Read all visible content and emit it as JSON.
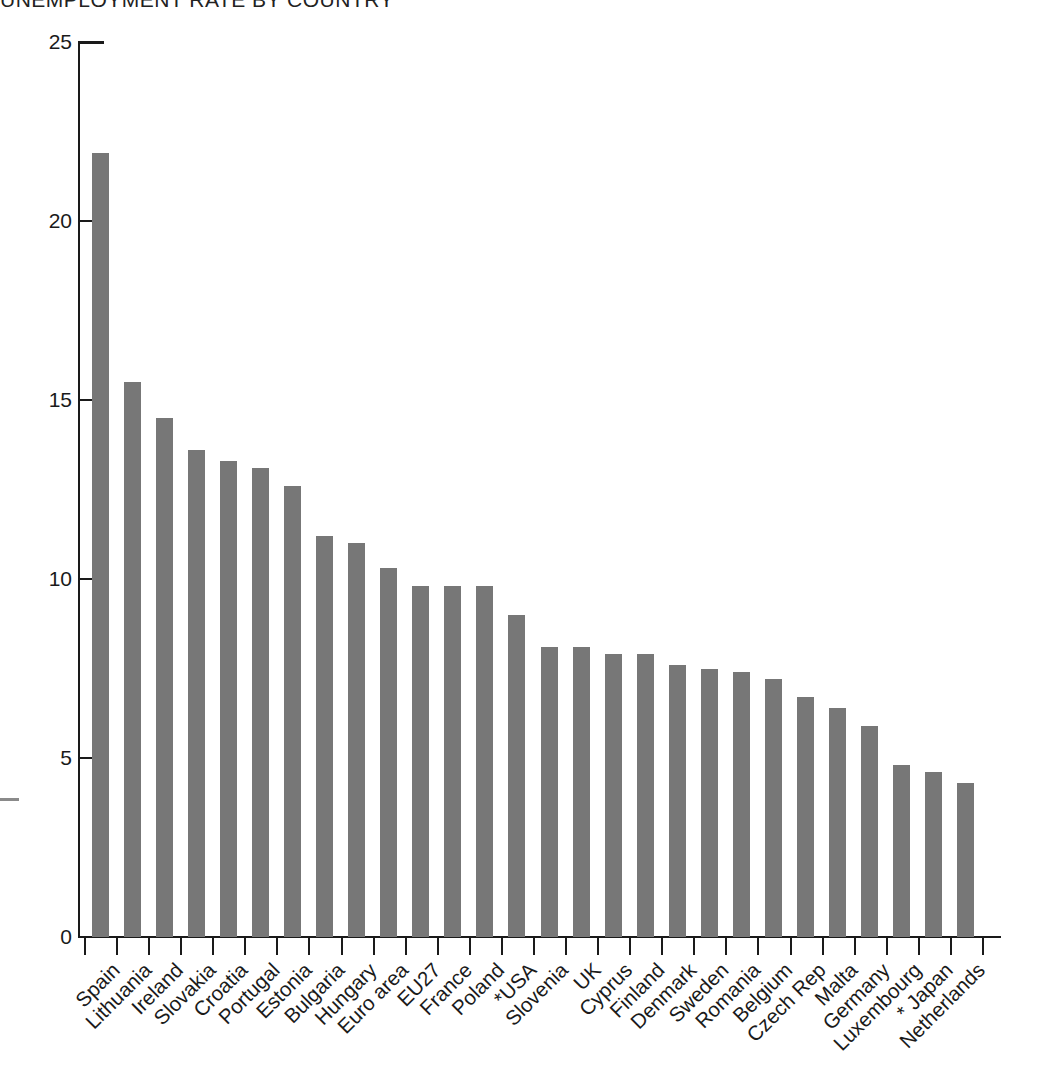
{
  "header": {
    "clipped_title": "UNEMPLOYMENT RATE BY COUNTRY"
  },
  "axes": {
    "y_ticks": [
      "0",
      "5",
      "10",
      "15",
      "20",
      "25"
    ],
    "y_min": 0,
    "y_max": 25
  },
  "chart_data": {
    "type": "bar",
    "title": "",
    "xlabel": "",
    "ylabel": "",
    "ylim": [
      0,
      25
    ],
    "yticks": [
      0,
      5,
      10,
      15,
      20,
      25
    ],
    "grid": false,
    "legend": null,
    "bar_color": "#777777",
    "axis_color": "#1a1a1a",
    "orientation": "vertical",
    "sorted": "descending",
    "categories": [
      "Spain",
      "Lithuania",
      "Ireland",
      "Slovakia",
      "Croatia",
      "Portugal",
      "Estonia",
      "Bulgaria",
      "Hungary",
      "Euro area",
      "EU27",
      "France",
      "Poland",
      "*USA",
      "Slovenia",
      "UK",
      "Cyprus",
      "Finland",
      "Denmark",
      "Sweden",
      "Romania",
      "Belgium",
      "Czech Rep",
      "Malta",
      "Germany",
      "Luxembourg",
      "* Japan",
      "Netherlands"
    ],
    "values": [
      21.9,
      15.5,
      14.5,
      13.6,
      13.3,
      13.1,
      12.6,
      11.2,
      11.0,
      10.3,
      9.8,
      9.8,
      9.8,
      9.0,
      8.1,
      8.1,
      7.9,
      7.9,
      7.6,
      7.5,
      7.4,
      7.2,
      6.7,
      6.4,
      5.9,
      4.8,
      4.6,
      4.3
    ]
  }
}
